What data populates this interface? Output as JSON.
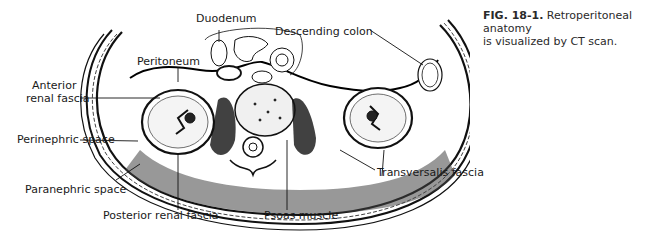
{
  "figure": {
    "labels": {
      "duodenum": "Duodenum",
      "descending_colon": "Descending colon",
      "peritoneum": "Peritoneum",
      "anterior_renal_fascia_line1": "Anterior",
      "anterior_renal_fascia_line2": "renal fascia",
      "perinephric_space": "Perinephric space",
      "paranephric_space": "Paranephric space",
      "posterior_renal_fascia": "Posterior renal fascia",
      "psoas_muscle": "Psoas muscle",
      "transversalis_fascia": "Transversalis fascia"
    }
  },
  "caption": {
    "number": "FIG. 18-1.",
    "text_line1": "Retroperitoneal anatomy",
    "text_line2": "is visualized by CT scan."
  }
}
